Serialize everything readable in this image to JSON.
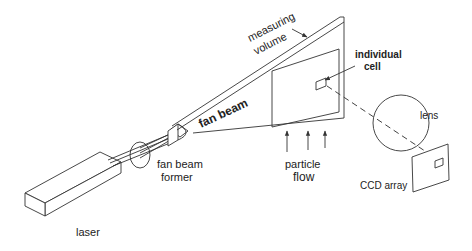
{
  "diagram": {
    "type": "optical setup schematic",
    "labels": {
      "measuring_volume_line1": "measuring",
      "measuring_volume_line2": "volume",
      "fan_beam": "fan beam",
      "individual_cell_line1": "individual",
      "individual_cell_line2": "cell",
      "lens": "lens",
      "particle_flow_line1": "particle",
      "particle_flow_line2": "flow",
      "fan_beam_former_line1": "fan beam",
      "fan_beam_former_line2": "former",
      "ccd_array": "CCD array",
      "laser": "laser"
    },
    "components": [
      "laser",
      "fan beam former",
      "fan beam",
      "measuring volume",
      "individual cell",
      "lens",
      "CCD array"
    ],
    "flow_arrows": 3,
    "colors": {
      "line": "#333333",
      "text": "#222222",
      "background": "#ffffff"
    }
  }
}
